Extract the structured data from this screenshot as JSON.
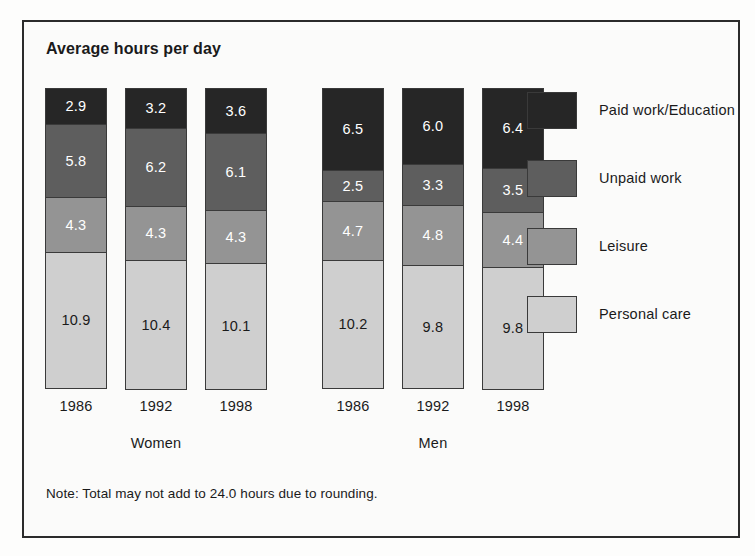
{
  "chart_data": {
    "type": "bar",
    "title": "Average hours per day",
    "subtitle": "",
    "xlabel": "",
    "ylabel": "",
    "stacked": true,
    "orientation": "vertical",
    "grid": false,
    "legend_position": "right",
    "ylim": [
      0,
      24
    ],
    "note": "Note: Total may not add to 24.0 hours due to rounding.",
    "groups": [
      {
        "name": "Women",
        "categories": [
          "1986",
          "1992",
          "1998"
        ]
      },
      {
        "name": "Men",
        "categories": [
          "1986",
          "1992",
          "1998"
        ]
      }
    ],
    "categories": [
      "1986",
      "1992",
      "1998",
      "1986",
      "1992",
      "1998"
    ],
    "series": [
      {
        "name": "Paid work/Education",
        "color": "#262626",
        "label_color": "#ffffff",
        "values": [
          2.9,
          3.2,
          3.6,
          6.5,
          6.0,
          6.4
        ]
      },
      {
        "name": "Unpaid work",
        "color": "#5e5e5e",
        "label_color": "#ffffff",
        "values": [
          5.8,
          6.2,
          6.1,
          2.5,
          3.3,
          3.5
        ]
      },
      {
        "name": "Leisure",
        "color": "#949494",
        "label_color": "#ffffff",
        "values": [
          4.3,
          4.3,
          4.3,
          4.7,
          4.8,
          4.4
        ]
      },
      {
        "name": "Personal care",
        "color": "#cfcfcf",
        "label_color": "#1a1a1a",
        "values": [
          10.9,
          10.4,
          10.1,
          10.2,
          9.8,
          9.8
        ]
      }
    ],
    "bars": [
      {
        "group": "Women",
        "year": "1986",
        "segments": [
          {
            "series": "Paid work/Education",
            "value": 2.9,
            "label": "2.9"
          },
          {
            "series": "Unpaid work",
            "value": 5.8,
            "label": "5.8"
          },
          {
            "series": "Leisure",
            "value": 4.3,
            "label": "4.3"
          },
          {
            "series": "Personal care",
            "value": 10.9,
            "label": "10.9"
          }
        ]
      },
      {
        "group": "Women",
        "year": "1992",
        "segments": [
          {
            "series": "Paid work/Education",
            "value": 3.2,
            "label": "3.2"
          },
          {
            "series": "Unpaid work",
            "value": 6.2,
            "label": "6.2"
          },
          {
            "series": "Leisure",
            "value": 4.3,
            "label": "4.3"
          },
          {
            "series": "Personal care",
            "value": 10.4,
            "label": "10.4"
          }
        ]
      },
      {
        "group": "Women",
        "year": "1998",
        "segments": [
          {
            "series": "Paid work/Education",
            "value": 3.6,
            "label": "3.6"
          },
          {
            "series": "Unpaid work",
            "value": 6.1,
            "label": "6.1"
          },
          {
            "series": "Leisure",
            "value": 4.3,
            "label": "4.3"
          },
          {
            "series": "Personal care",
            "value": 10.1,
            "label": "10.1"
          }
        ]
      },
      {
        "group": "Men",
        "year": "1986",
        "segments": [
          {
            "series": "Paid work/Education",
            "value": 6.5,
            "label": "6.5"
          },
          {
            "series": "Unpaid work",
            "value": 2.5,
            "label": "2.5"
          },
          {
            "series": "Leisure",
            "value": 4.7,
            "label": "4.7"
          },
          {
            "series": "Personal care",
            "value": 10.2,
            "label": "10.2"
          }
        ]
      },
      {
        "group": "Men",
        "year": "1992",
        "segments": [
          {
            "series": "Paid work/Education",
            "value": 6.0,
            "label": "6.0"
          },
          {
            "series": "Unpaid work",
            "value": 3.3,
            "label": "3.3"
          },
          {
            "series": "Leisure",
            "value": 4.8,
            "label": "4.8"
          },
          {
            "series": "Personal care",
            "value": 9.8,
            "label": "9.8"
          }
        ]
      },
      {
        "group": "Men",
        "year": "1998",
        "segments": [
          {
            "series": "Paid work/Education",
            "value": 6.4,
            "label": "6.4"
          },
          {
            "series": "Unpaid work",
            "value": 3.5,
            "label": "3.5"
          },
          {
            "series": "Leisure",
            "value": 4.4,
            "label": "4.4"
          },
          {
            "series": "Personal care",
            "value": 9.8,
            "label": "9.8"
          }
        ]
      }
    ],
    "legend": [
      {
        "label": "Paid work/Education",
        "color": "#262626"
      },
      {
        "label": "Unpaid work",
        "color": "#5e5e5e"
      },
      {
        "label": "Leisure",
        "color": "#949494"
      },
      {
        "label": "Personal care",
        "color": "#cfcfcf"
      }
    ]
  },
  "colors": {
    "paid_work": "#262626",
    "unpaid_work": "#5e5e5e",
    "leisure": "#949494",
    "personal_care": "#cfcfcf",
    "frame": "#2b2b2b",
    "text": "#1a1a1a",
    "background": "#fbfbfa"
  }
}
